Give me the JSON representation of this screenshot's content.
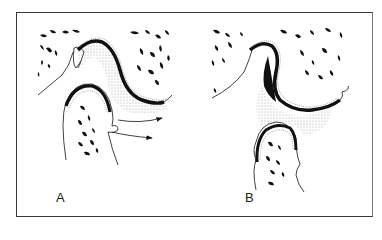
{
  "figure": {
    "panels": [
      {
        "id": "A",
        "label": "A",
        "features": [
          "articular fossa",
          "condylar head",
          "joint space (stippled)",
          "two arrows pointing right"
        ]
      },
      {
        "id": "B",
        "label": "B",
        "features": [
          "articular fossa",
          "condylar head displaced downward",
          "enlarged stippled joint space"
        ]
      }
    ],
    "colors": {
      "ink": "#111111",
      "stipple": "#cfcfcf",
      "frame": "#3a3a3a",
      "background": "#ffffff"
    }
  }
}
